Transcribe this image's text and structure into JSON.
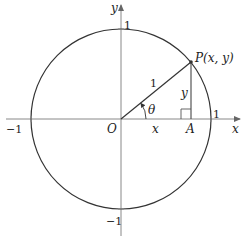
{
  "diagram": {
    "labels": {
      "y_axis": "y",
      "x_axis": "x",
      "top_tick": "1",
      "bottom_tick": "−1",
      "left_tick": "−1",
      "right_tick": "1",
      "origin": "O",
      "point_p": "P(x, y)",
      "foot_a": "A",
      "radius": "1",
      "angle": "θ",
      "adjacent": "x",
      "opposite": "y"
    },
    "colors": {
      "circle": "#333333",
      "axes": "#888888",
      "segments": "#333333",
      "text": "#222222"
    }
  }
}
